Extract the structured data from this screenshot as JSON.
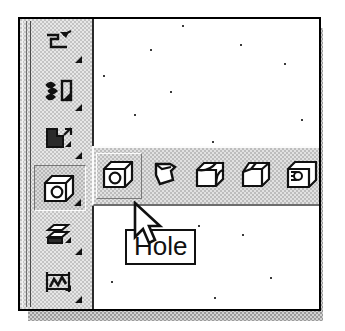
{
  "app": {
    "kind": "cad-modeling-application",
    "screenshot_description": "Scanned CAD screenshot: vertical feature toolbar with an open horizontal flyout toolbar and a 'Hole' tooltip under the mouse cursor"
  },
  "colors": {
    "window_border": "#000000",
    "window_shadow": "#9a9a9a",
    "toolbar_face": "#c3c3c3",
    "flyout_face": "#bdbdbd",
    "highlight": "#fbfbfb",
    "shade": "#6e6e6e",
    "canvas": "#ffffff",
    "icon_ink": "#111111",
    "tooltip_bg": "#ffffff",
    "tooltip_border": "#111111",
    "tooltip_text": "#111111"
  },
  "feature_toolbar": {
    "name": "Part Features",
    "orientation": "vertical",
    "items": [
      {
        "label": "Sweep",
        "icon": "sweep-icon",
        "has_flyout": true,
        "state": "normal"
      },
      {
        "label": "Coil",
        "icon": "coil-icon",
        "has_flyout": true,
        "state": "normal"
      },
      {
        "label": "Loft",
        "icon": "loft-icon",
        "has_flyout": true,
        "state": "normal"
      },
      {
        "label": "Hole",
        "icon": "hole-icon",
        "has_flyout": true,
        "state": "pressed"
      },
      {
        "label": "Shell",
        "icon": "shell-icon",
        "has_flyout": true,
        "state": "normal"
      },
      {
        "label": "Pattern",
        "icon": "pattern-icon",
        "has_flyout": true,
        "state": "normal"
      }
    ]
  },
  "flyout_toolbar": {
    "name": "Hole flyout",
    "orientation": "horizontal",
    "open": true,
    "clipped_right": true,
    "items": [
      {
        "label": "Hole",
        "icon": "hole-icon",
        "state": "hovered"
      },
      {
        "label": "Shell",
        "icon": "shell-icon",
        "state": "normal"
      },
      {
        "label": "Fillet",
        "icon": "fillet-icon",
        "state": "normal"
      },
      {
        "label": "Chamfer",
        "icon": "chamfer-icon",
        "state": "normal"
      },
      {
        "label": "Thread",
        "icon": "thread-icon",
        "state": "normal"
      }
    ]
  },
  "tooltip": {
    "text": "Hole",
    "visible": true
  },
  "cursor": {
    "icon": "mouse-pointer-icon",
    "x": 112,
    "y": 182
  },
  "canvas": {
    "label": "graphics-window",
    "background": "#ffffff",
    "specks": [
      [
        182,
        10
      ],
      [
        150,
        35
      ],
      [
        61,
        60
      ],
      [
        251,
        28
      ],
      [
        293,
        48
      ],
      [
        215,
        128
      ],
      [
        104,
        148
      ],
      [
        172,
        78
      ],
      [
        110,
        105
      ],
      [
        200,
        168
      ],
      [
        243,
        210
      ],
      [
        120,
        240
      ],
      [
        266,
        258
      ],
      [
        63,
        268
      ],
      [
        155,
        283
      ],
      [
        205,
        120
      ],
      [
        42,
        208
      ],
      [
        278,
        155
      ]
    ]
  }
}
